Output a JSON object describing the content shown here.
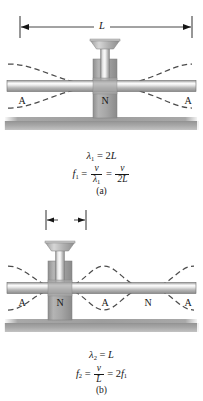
{
  "figure": {
    "colors": {
      "ink": "#161616",
      "rod_light": "#f2f2f2",
      "rod_mid": "#b9b9b9",
      "rod_dark": "#8d8d8d",
      "clamp_light": "#c6c6c6",
      "clamp_mid": "#a3a3a3",
      "clamp_dark": "#8a8a8a",
      "table_gray": "#9e9e9e",
      "wave_dash": "#4a4a4a",
      "background": "#ffffff"
    }
  },
  "panel_a": {
    "caption": "(a)",
    "dimension": {
      "name": "rod-length",
      "label": "L"
    },
    "markers": [
      {
        "label": "A",
        "kind": "antinode",
        "x": 22
      },
      {
        "label": "N",
        "kind": "node",
        "x": 105
      },
      {
        "label": "A",
        "kind": "antinode",
        "x": 188
      }
    ],
    "equations": {
      "wavelength": {
        "symbol": "λ",
        "subscript": "1",
        "equals": "=",
        "value_coefficient": "2",
        "value_variable": "L",
        "plain": "λ1 = 2L"
      },
      "frequency": {
        "symbol": "f",
        "subscript": "1",
        "equals": "=",
        "term1_num": "v",
        "term1_den_symbol": "λ",
        "term1_den_sub": "1",
        "equals2": "=",
        "term2_num": "v",
        "term2_den": "2L",
        "plain": "f1 = v/λ1 = v/2L"
      }
    },
    "mode": {
      "harmonic": 1,
      "clamp_position_fraction": 0.5,
      "wavelengths_shown": 1
    }
  },
  "panel_b": {
    "caption": "(b)",
    "dimension": {
      "name": "clamp-offset",
      "numerator": "L",
      "denominator": "4",
      "plain": "L/4"
    },
    "markers": [
      {
        "label": "A",
        "kind": "antinode",
        "x": 22
      },
      {
        "label": "N",
        "kind": "node",
        "x": 60
      },
      {
        "label": "A",
        "kind": "antinode",
        "x": 105
      },
      {
        "label": "N",
        "kind": "node",
        "x": 148
      },
      {
        "label": "A",
        "kind": "antinode",
        "x": 188
      }
    ],
    "equations": {
      "wavelength": {
        "symbol": "λ",
        "subscript": "2",
        "equals": "=",
        "value_variable": "L",
        "plain": "λ2 = L"
      },
      "frequency": {
        "symbol": "f",
        "subscript": "2",
        "equals": "=",
        "term1_num": "v",
        "term1_den": "L",
        "equals2": "=",
        "term2_coefficient": "2",
        "term2_symbol": "f",
        "term2_sub": "1",
        "plain": "f2 = v/L = 2f1"
      }
    },
    "mode": {
      "harmonic": 2,
      "clamp_position_fraction": 0.25,
      "wavelengths_shown": 2
    }
  }
}
